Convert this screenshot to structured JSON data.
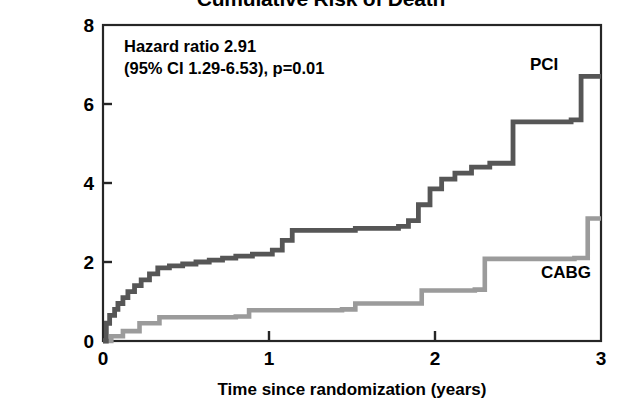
{
  "chart_data": {
    "type": "line",
    "title": "Cumulative Risk of Death",
    "xlabel": "Time since randomization (years)",
    "ylabel": "Cumulative\nproportion at risk (%)",
    "ylabel_line1": "Cumulative",
    "ylabel_line2": "proportion at risk (%)",
    "xlim": [
      0,
      3
    ],
    "ylim": [
      0,
      8
    ],
    "xticks": [
      0,
      1,
      2,
      3
    ],
    "xtick_labels": [
      "0",
      "1",
      "2",
      "3"
    ],
    "yticks": [
      0,
      2,
      4,
      6,
      8
    ],
    "ytick_labels": [
      "0",
      "2",
      "4",
      "6",
      "8"
    ],
    "grid": false,
    "legend_position": "inline-at-curve-ends",
    "step_style": "post",
    "annotations": [
      {
        "name": "hazard-ratio-annotation",
        "line1": "Hazard ratio 2.91",
        "line2": "(95% CI 1.29-6.53), p=0.01",
        "text": "Hazard ratio 2.91\n(95% CI 1.29-6.53), p=0.01",
        "hazard_ratio": 2.91,
        "ci_low": 1.29,
        "ci_high": 6.53,
        "p_value": "0.01"
      }
    ],
    "series": [
      {
        "name": "PCI",
        "label": "PCI",
        "color": "#565656",
        "final_value": 6.7,
        "x": [
          0.0,
          0.02,
          0.04,
          0.07,
          0.09,
          0.12,
          0.15,
          0.19,
          0.23,
          0.28,
          0.33,
          0.4,
          0.48,
          0.56,
          0.64,
          0.72,
          0.8,
          0.9,
          1.02,
          1.08,
          1.14,
          1.52,
          1.78,
          1.84,
          1.9,
          1.97,
          2.04,
          2.12,
          2.22,
          2.33,
          2.47,
          2.82,
          2.88,
          3.0
        ],
        "y": [
          0.0,
          0.45,
          0.65,
          0.8,
          0.95,
          1.1,
          1.25,
          1.4,
          1.55,
          1.7,
          1.85,
          1.9,
          1.95,
          2.0,
          2.05,
          2.1,
          2.15,
          2.2,
          2.3,
          2.55,
          2.8,
          2.85,
          2.9,
          3.05,
          3.45,
          3.85,
          4.1,
          4.25,
          4.4,
          4.5,
          5.55,
          5.6,
          6.7,
          6.7
        ]
      },
      {
        "name": "CABG",
        "label": "CABG",
        "color": "#9b9b9b",
        "final_value": 3.1,
        "x": [
          0.0,
          0.05,
          0.12,
          0.22,
          0.34,
          0.8,
          0.88,
          1.44,
          1.52,
          1.92,
          2.24,
          2.3,
          2.84,
          2.92,
          3.0
        ],
        "y": [
          0.0,
          0.12,
          0.25,
          0.45,
          0.6,
          0.62,
          0.78,
          0.8,
          0.95,
          1.28,
          1.3,
          2.08,
          2.1,
          3.1,
          3.1
        ]
      }
    ]
  },
  "figure": {
    "background": "#ffffff",
    "axis_color": "#262626",
    "text_color": "#000000"
  }
}
